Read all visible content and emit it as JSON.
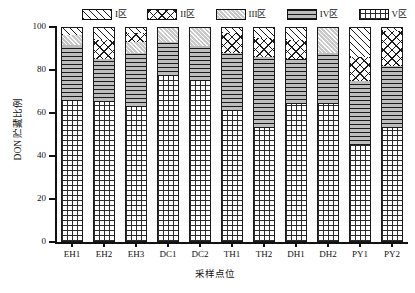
{
  "chart_data": {
    "type": "bar",
    "subtype": "stacked-percentage-column",
    "title": "",
    "xlabel": "采样点位",
    "ylabel": "DON 贮藏比例",
    "ylim": [
      0,
      100
    ],
    "yticks": [
      0,
      20,
      40,
      60,
      80,
      100
    ],
    "ytick_labels": [
      "0",
      "20",
      "40",
      "60",
      "80",
      "100"
    ],
    "grid": false,
    "legend_position": "top",
    "categories": [
      "EH1",
      "EH2",
      "EH3",
      "DC1",
      "DC2",
      "TH1",
      "TH2",
      "DH1",
      "DH2",
      "PY1",
      "PY2"
    ],
    "series": [
      {
        "name": "I区",
        "pattern": "diagonal-hatch",
        "values": [
          3.5,
          6.0,
          3.0,
          0.0,
          0.0,
          3.0,
          5.0,
          6.0,
          0.0,
          14.0,
          2.0
        ]
      },
      {
        "name": "II区",
        "pattern": "diamond-cross-hatch",
        "values": [
          0.0,
          9.0,
          4.0,
          0.0,
          0.0,
          9.0,
          9.0,
          9.0,
          0.0,
          11.0,
          16.0
        ]
      },
      {
        "name": "III区",
        "pattern": "dense-diagonal-gray",
        "values": [
          5.0,
          0.0,
          5.0,
          7.0,
          9.0,
          0.0,
          0.0,
          0.0,
          12.0,
          0.0,
          0.0
        ]
      },
      {
        "name": "IV区",
        "pattern": "horizontal-lines",
        "values": [
          26.0,
          20.0,
          25.0,
          16.0,
          16.0,
          27.0,
          33.0,
          21.0,
          24.0,
          30.0,
          29.0
        ]
      },
      {
        "name": "V区",
        "pattern": "grid-crosshatch",
        "values": [
          65.5,
          65.0,
          63.0,
          77.0,
          75.0,
          61.0,
          53.0,
          64.0,
          64.0,
          45.0,
          53.0
        ]
      }
    ]
  },
  "legend": {
    "items": [
      {
        "label": "I区"
      },
      {
        "label": "II区"
      },
      {
        "label": "III区"
      },
      {
        "label": "IV区"
      },
      {
        "label": "V区"
      }
    ]
  },
  "axes": {
    "y_title": "DON 贮藏比例",
    "x_title": "采样点位"
  }
}
